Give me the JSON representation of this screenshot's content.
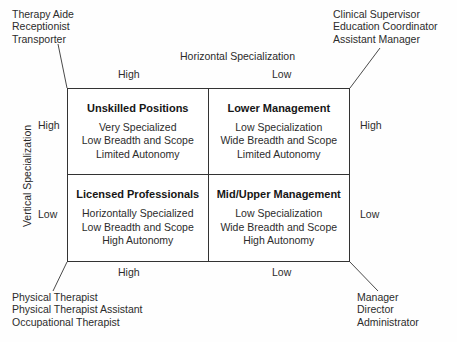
{
  "diagram": {
    "axes": {
      "horizontal_title": "Horizontal Specialization",
      "vertical_title": "Vertical Specialization",
      "top_high": "High",
      "top_low": "Low",
      "bottom_high": "High",
      "bottom_low": "Low",
      "left_high": "High",
      "left_low": "Low",
      "right_high": "High",
      "right_low": "Low"
    },
    "quadrants": [
      {
        "id": "unskilled-positions",
        "title": "Unskilled Positions",
        "lines": [
          "Very Specialized",
          "Low Breadth and Scope",
          "Limited Autonomy"
        ]
      },
      {
        "id": "lower-management",
        "title": "Lower Management",
        "lines": [
          "Low Specialization",
          "Wide Breadth and Scope",
          "Limited Autonomy"
        ]
      },
      {
        "id": "licensed-professionals",
        "title": "Licensed Professionals",
        "lines": [
          "Horizontally Specialized",
          "Low Breadth and Scope",
          "High Autonomy"
        ]
      },
      {
        "id": "mid-upper-management",
        "title": "Mid/Upper Management",
        "lines": [
          "Low Specialization",
          "Wide Breadth and Scope",
          "High Autonomy"
        ]
      }
    ],
    "callouts": {
      "top_left": [
        "Therapy Aide",
        "Receptionist",
        "Transporter"
      ],
      "top_right": [
        "Clinical Supervisor",
        "Education Coordinator",
        "Assistant Manager"
      ],
      "bottom_left": [
        "Physical Therapist",
        "Physical Therapist Assistant",
        "Occupational Therapist"
      ],
      "bottom_right": [
        "Manager",
        "Director",
        "Administrator"
      ]
    },
    "colors": {
      "background": "#fefefe",
      "border": "#333333",
      "text": "#2c2c2c",
      "title_text": "#161616"
    }
  }
}
